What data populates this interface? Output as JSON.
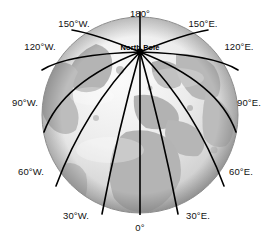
{
  "figure": {
    "type": "globe-meridian-diagram",
    "background_color": "#ffffff",
    "width": 274,
    "height": 239
  },
  "globe": {
    "center_x": 140,
    "center_y": 115,
    "radius": 98,
    "ocean_color": "#e8e8e8",
    "land_color": "#b4b4b4",
    "shadow_color": "#9a9a9a",
    "highlight_color": "#f5f5f5",
    "outline_color": "#8c8c8c"
  },
  "pole": {
    "label": "North Pole",
    "x": 140,
    "y": 52,
    "marker_color": "#000000"
  },
  "meridians": {
    "line_color": "#000000",
    "line_width": 1.6,
    "count": 12
  },
  "labels": [
    {
      "id": "lon-180",
      "text": "180°",
      "x": 140,
      "y": 14,
      "align": "center"
    },
    {
      "id": "lon-150w",
      "text": "150°W.",
      "x": 74,
      "y": 24,
      "align": "center"
    },
    {
      "id": "lon-120w",
      "text": "120°W.",
      "x": 40,
      "y": 47,
      "align": "center"
    },
    {
      "id": "lon-90w",
      "text": "90°W.",
      "x": 25,
      "y": 103,
      "align": "center"
    },
    {
      "id": "lon-60w",
      "text": "60°W.",
      "x": 31,
      "y": 172,
      "align": "center"
    },
    {
      "id": "lon-30w",
      "text": "30°W.",
      "x": 76,
      "y": 216,
      "align": "center"
    },
    {
      "id": "lon-0",
      "text": "0°",
      "x": 140,
      "y": 228,
      "align": "center"
    },
    {
      "id": "lon-30e",
      "text": "30°E.",
      "x": 198,
      "y": 216,
      "align": "center"
    },
    {
      "id": "lon-60e",
      "text": "60°E.",
      "x": 241,
      "y": 172,
      "align": "center"
    },
    {
      "id": "lon-90e",
      "text": "90°E.",
      "x": 249,
      "y": 103,
      "align": "center"
    },
    {
      "id": "lon-120e",
      "text": "120°E.",
      "x": 239,
      "y": 47,
      "align": "center"
    },
    {
      "id": "lon-150e",
      "text": "150°E.",
      "x": 203,
      "y": 24,
      "align": "center"
    }
  ]
}
